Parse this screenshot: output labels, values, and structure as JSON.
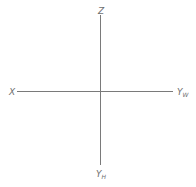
{
  "diagram": {
    "type": "projection-axes",
    "line_color": "#7a7a7a",
    "label_color": "#6e6e6e",
    "origin": {
      "x": 100,
      "y": 91
    },
    "axes": [
      {
        "id": "z",
        "label": "Z",
        "subscript": "",
        "direction": "up"
      },
      {
        "id": "x",
        "label": "X",
        "subscript": "",
        "direction": "left"
      },
      {
        "id": "yw",
        "label": "Y",
        "subscript": "W",
        "direction": "right"
      },
      {
        "id": "yh",
        "label": "Y",
        "subscript": "H",
        "direction": "down"
      }
    ]
  }
}
